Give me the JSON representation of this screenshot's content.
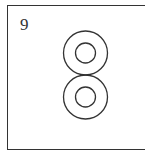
{
  "panel": {
    "number": "9",
    "stroke_color": "#333333",
    "background": "#ffffff"
  },
  "figure": {
    "circle_groups": [
      {
        "name": "upper",
        "cx": 85.5,
        "cy": 53,
        "outer_r": 22,
        "inner_r": 10
      },
      {
        "name": "lower",
        "cx": 85.5,
        "cy": 97,
        "outer_r": 22,
        "inner_r": 10
      }
    ]
  }
}
